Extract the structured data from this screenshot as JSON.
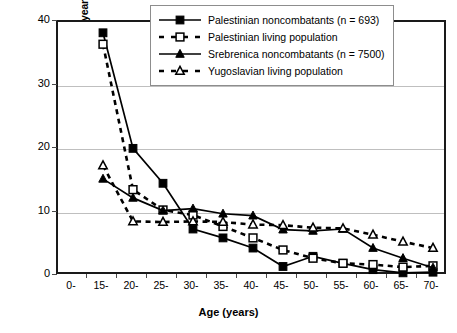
{
  "chart_data": {
    "type": "line",
    "title": "",
    "xlabel": "Age (years)",
    "ylabel": "Percentage of population (>10 years)",
    "categories": [
      "0-",
      "15-",
      "20-",
      "25-",
      "30-",
      "35-",
      "40-",
      "45-",
      "50-",
      "55-",
      "60-",
      "65-",
      "70-"
    ],
    "xlim": [
      0,
      12
    ],
    "ylim": [
      0,
      40
    ],
    "yticks": [
      0,
      10,
      20,
      30,
      40
    ],
    "grid": "horizontal",
    "legend_position": "top-right",
    "series": [
      {
        "name": "Palestinian noncombatants (n = 693)",
        "marker": "filled-square",
        "line": "solid",
        "color": "#000000",
        "values": [
          null,
          38.3,
          20.1,
          14.6,
          7.4,
          6.0,
          4.4,
          1.5,
          3.1,
          2.0,
          1.0,
          0.5,
          0.6
        ]
      },
      {
        "name": "Palestinian living population",
        "marker": "open-square",
        "line": "dashed",
        "color": "#000000",
        "values": [
          null,
          36.5,
          13.6,
          10.4,
          9.6,
          7.8,
          6.0,
          4.1,
          2.8,
          2.0,
          1.8,
          1.4,
          1.6
        ]
      },
      {
        "name": "Srebrenica noncombatants (n = 7500)",
        "marker": "filled-triangle",
        "line": "solid",
        "color": "#000000",
        "values": [
          null,
          15.3,
          12.3,
          10.3,
          10.6,
          9.8,
          9.5,
          7.3,
          7.1,
          7.4,
          4.4,
          2.8,
          1.3
        ]
      },
      {
        "name": "Yugoslavian living population",
        "marker": "open-triangle",
        "line": "dashed",
        "color": "#000000",
        "values": [
          null,
          17.4,
          8.6,
          8.5,
          8.6,
          8.5,
          8.1,
          8.0,
          7.6,
          7.5,
          6.5,
          5.4,
          4.4
        ]
      }
    ]
  }
}
